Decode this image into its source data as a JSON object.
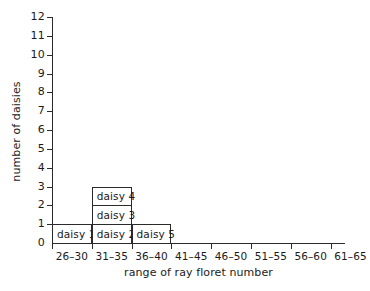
{
  "chart_data": {
    "type": "bar",
    "title": "",
    "subtitle": "",
    "xlabel": "range of ray floret number",
    "ylabel": "number of daisies",
    "categories": [
      "26–30",
      "31–35",
      "36–40",
      "41–45",
      "46–50",
      "51–55",
      "56–60",
      "61–65"
    ],
    "values": [
      1,
      3,
      1,
      0,
      0,
      0,
      0,
      0
    ],
    "ylim": [
      0,
      12
    ],
    "yticks": [
      "0",
      "1",
      "2",
      "3",
      "4",
      "5",
      "6",
      "7",
      "8",
      "9",
      "10",
      "11",
      "12"
    ],
    "grid": false,
    "legend": null,
    "bar_fill_color": "#ffffff",
    "bar_border_color": "#2b2b2b",
    "axis_color": "#2b2b2b",
    "background_color": "#ffffff",
    "stacked_labels": [
      [
        "daisy 1"
      ],
      [
        "daisy 2",
        "daisy 3",
        "daisy 4"
      ],
      [
        "daisy 5"
      ],
      [],
      [],
      [],
      [],
      []
    ],
    "annotations": [
      "daisy 1",
      "daisy 2",
      "daisy 3",
      "daisy 4",
      "daisy 5"
    ]
  }
}
